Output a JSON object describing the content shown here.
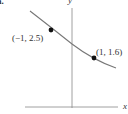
{
  "figure": {
    "part_label": "a.",
    "axes": {
      "x_label": "x",
      "y_label": "y"
    },
    "points": [
      {
        "label": "(−1, 2.5)",
        "x": -1,
        "y": 2.5
      },
      {
        "label": "(1, 1.6)",
        "x": 1,
        "y": 1.6
      }
    ],
    "colors": {
      "axis": "#888888",
      "curve": "#777777",
      "point": "#111111",
      "text": "#333333"
    }
  }
}
